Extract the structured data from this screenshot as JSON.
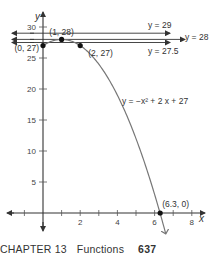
{
  "chart_data": {
    "type": "line",
    "title": "",
    "xlabel": "x",
    "ylabel": "y",
    "xlim": [
      -1.5,
      9.5
    ],
    "ylim": [
      -2,
      32
    ],
    "x_ticks": [
      -1,
      1,
      2,
      3,
      4,
      5,
      6,
      7,
      8
    ],
    "x_tick_labels": [
      {
        "v": 2,
        "t": "2"
      },
      {
        "v": 4,
        "t": "4"
      },
      {
        "v": 6,
        "t": "6"
      },
      {
        "v": 8,
        "t": "8"
      }
    ],
    "y_ticks": [
      {
        "v": 5,
        "t": "5"
      },
      {
        "v": 10,
        "t": "10"
      },
      {
        "v": 15,
        "t": "15"
      },
      {
        "v": 20,
        "t": "20"
      },
      {
        "v": 25,
        "t": "25"
      },
      {
        "v": 30,
        "t": "30"
      }
    ],
    "curve": {
      "equation": "y = −x² + 2 x + 27",
      "a": -1,
      "b": 2,
      "c": 27,
      "x_start": 0,
      "x_end": 6.6
    },
    "horizontal_lines": [
      {
        "y": 29,
        "label": "y = 29"
      },
      {
        "y": 28,
        "label": "y = 28"
      },
      {
        "y": 27.5,
        "label": "y = 27.5"
      }
    ],
    "points": [
      {
        "x": 0,
        "y": 27,
        "label": "(0, 27)"
      },
      {
        "x": 1,
        "y": 28,
        "label": "(1, 28)"
      },
      {
        "x": 2,
        "y": 27,
        "label": "(2, 27)"
      },
      {
        "x": 6.3,
        "y": 0,
        "label": "(6.3, 0)"
      }
    ]
  },
  "footer": {
    "chapter": "CHAPTER 13",
    "section": "Functions",
    "page": "637"
  }
}
